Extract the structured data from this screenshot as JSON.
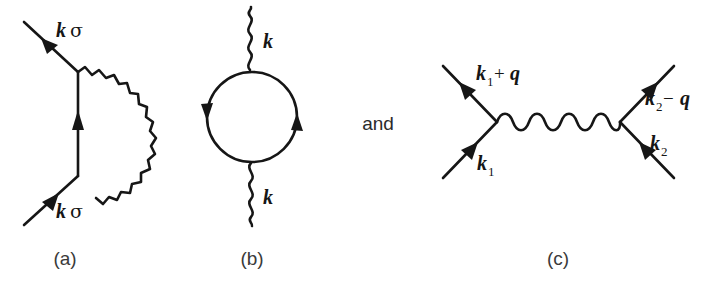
{
  "figure": {
    "type": "feynman-diagram-set",
    "background_color": "#ffffff",
    "ink_color": "#161616",
    "connector_text": "and",
    "panels": [
      {
        "id": "a",
        "caption": "(a)",
        "name": "self-energy-diagram",
        "description": "Electron self-energy: fermion line with a wavy boson line looping from the lower vertex to the upper vertex.",
        "labels": [
          {
            "name": "outgoing-electron-label",
            "momentum": "k",
            "spin": "σ",
            "text": "kσ",
            "position": "upper-left"
          },
          {
            "name": "incoming-electron-label",
            "momentum": "k",
            "spin": "σ",
            "text": "kσ",
            "position": "lower-left"
          }
        ],
        "lines": [
          {
            "kind": "fermion",
            "name": "outgoing-fermion-line",
            "arrow": "outward-up-left"
          },
          {
            "kind": "fermion",
            "name": "internal-fermion-line",
            "arrow": "up"
          },
          {
            "kind": "fermion",
            "name": "incoming-fermion-line",
            "arrow": "inward-up-right"
          },
          {
            "kind": "boson-wavy",
            "name": "self-energy-boson-arc",
            "arrow": "none"
          }
        ]
      },
      {
        "id": "b",
        "caption": "(b)",
        "name": "polarization-bubble-diagram",
        "description": "Boson self-energy / polarization bubble: a closed fermion loop with wavy boson lines entering at the top and leaving at the bottom.",
        "labels": [
          {
            "name": "top-boson-label",
            "momentum": "k",
            "text": "k",
            "position": "top"
          },
          {
            "name": "bottom-boson-label",
            "momentum": "k",
            "text": "k",
            "position": "bottom"
          }
        ],
        "lines": [
          {
            "kind": "boson-wavy",
            "name": "top-boson-line",
            "arrow": "none"
          },
          {
            "kind": "fermion-loop",
            "name": "fermion-loop",
            "arrow": "counterclockwise-pair"
          },
          {
            "kind": "boson-wavy",
            "name": "bottom-boson-line",
            "arrow": "none"
          }
        ]
      },
      {
        "id": "c",
        "caption": "(c)",
        "name": "electron-electron-scattering-diagram",
        "description": "Two-electron scattering with momentum transfer q carried by a horizontal wavy boson line between two vertices.",
        "labels": [
          {
            "name": "outgoing-left-label",
            "text": "k1 + q",
            "base": "k",
            "sub": "1",
            "operator": "+",
            "transfer": "q",
            "position": "upper-left"
          },
          {
            "name": "incoming-left-label",
            "text": "k1",
            "base": "k",
            "sub": "1",
            "position": "lower-left"
          },
          {
            "name": "outgoing-right-label",
            "text": "k2 − q",
            "base": "k",
            "sub": "2",
            "operator": "−",
            "transfer": "q",
            "position": "upper-right"
          },
          {
            "name": "incoming-right-label",
            "text": "k2",
            "base": "k",
            "sub": "2",
            "position": "lower-right"
          }
        ],
        "lines": [
          {
            "kind": "fermion",
            "name": "incoming-left-fermion-line",
            "arrow": "inward-up-right"
          },
          {
            "kind": "fermion",
            "name": "outgoing-left-fermion-line",
            "arrow": "outward-up-left"
          },
          {
            "kind": "boson-wavy",
            "name": "momentum-transfer-boson-line",
            "arrow": "none"
          },
          {
            "kind": "fermion",
            "name": "incoming-right-fermion-line",
            "arrow": "inward-up-left"
          },
          {
            "kind": "fermion",
            "name": "outgoing-right-fermion-line",
            "arrow": "outward-up-right"
          }
        ]
      }
    ],
    "glyphs": {
      "k": "k",
      "q": "q",
      "sigma": "σ",
      "plus": "+",
      "minus": "−",
      "sub_one": "1",
      "sub_two": "2"
    }
  }
}
